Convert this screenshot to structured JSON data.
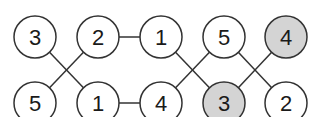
{
  "diagram": {
    "colors": {
      "stroke": "#333333",
      "plain_fill": "#ffffff",
      "shaded_fill": "#d4d4d4",
      "text": "#1a1a1a"
    },
    "nodes": [
      {
        "id": "t0",
        "label": "3",
        "row": "top",
        "col": 0,
        "shaded": false
      },
      {
        "id": "t1",
        "label": "2",
        "row": "top",
        "col": 1,
        "shaded": false
      },
      {
        "id": "t2",
        "label": "1",
        "row": "top",
        "col": 2,
        "shaded": false
      },
      {
        "id": "t3",
        "label": "5",
        "row": "top",
        "col": 3,
        "shaded": false
      },
      {
        "id": "t4",
        "label": "4",
        "row": "top",
        "col": 4,
        "shaded": true
      },
      {
        "id": "b0",
        "label": "5",
        "row": "bottom",
        "col": 0,
        "shaded": false
      },
      {
        "id": "b1",
        "label": "1",
        "row": "bottom",
        "col": 1,
        "shaded": false
      },
      {
        "id": "b2",
        "label": "4",
        "row": "bottom",
        "col": 2,
        "shaded": false
      },
      {
        "id": "b3",
        "label": "3",
        "row": "bottom",
        "col": 3,
        "shaded": true
      },
      {
        "id": "b4",
        "label": "2",
        "row": "bottom",
        "col": 4,
        "shaded": false
      }
    ],
    "edges": [
      [
        "t0",
        "b1"
      ],
      [
        "t1",
        "b0"
      ],
      [
        "t1",
        "t2"
      ],
      [
        "t2",
        "b3"
      ],
      [
        "t3",
        "b2"
      ],
      [
        "t3",
        "b4"
      ],
      [
        "t4",
        "b3"
      ],
      [
        "b1",
        "b2"
      ]
    ]
  }
}
